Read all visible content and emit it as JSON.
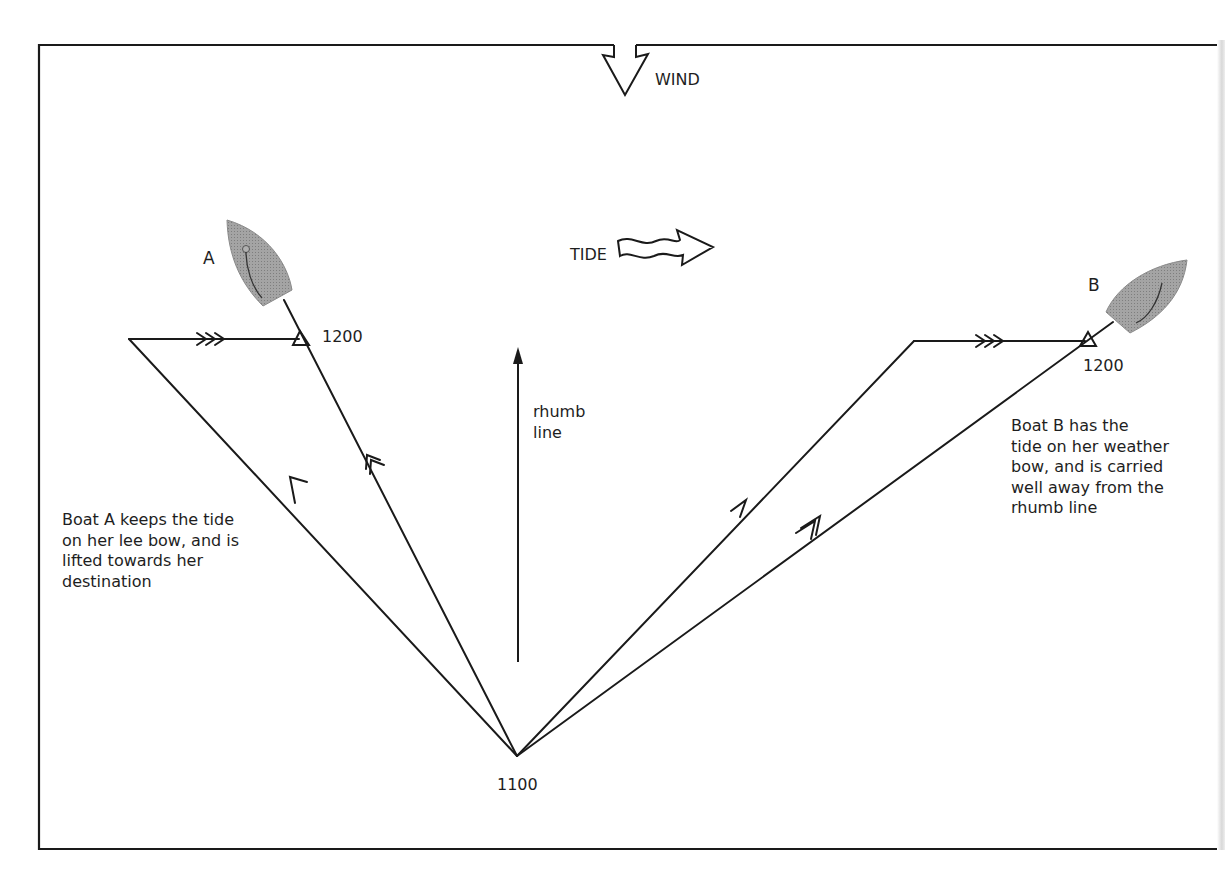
{
  "diagram": {
    "type": "sailing tidal tactics diagram",
    "labels": {
      "wind": "WIND",
      "tide": "TIDE",
      "rhumb_line": "rhumb\nline",
      "boat_a": "A",
      "boat_b": "B",
      "time_a_end": "1200",
      "time_b_end": "1200",
      "time_start": "1100"
    },
    "captions": {
      "boat_a": "Boat A keeps the tide\non her lee bow, and is\nlifted towards her\ndestination",
      "boat_b": "Boat B has the\ntide on her weather\nbow, and is carried\nwell away from the\nrhumb line"
    },
    "colors": {
      "line": "#1a1a1a",
      "hull_fill": "#9a9a9a",
      "background": "#ffffff"
    }
  }
}
